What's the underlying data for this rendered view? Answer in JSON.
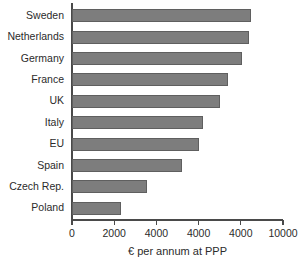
{
  "chart_data": {
    "type": "bar",
    "orientation": "horizontal",
    "title": "",
    "xlabel": "€ per annum at PPP",
    "ylabel": "",
    "xlim": [
      0,
      10000
    ],
    "grid": false,
    "legend": null,
    "categories": [
      "Sweden",
      "Netherlands",
      "Germany",
      "France",
      "UK",
      "Italy",
      "EU",
      "Spain",
      "Czech Rep.",
      "Poland"
    ],
    "values": [
      8500,
      8400,
      8050,
      7400,
      7000,
      6200,
      6000,
      5200,
      3550,
      2300
    ],
    "xticks": [
      0,
      2000,
      4000,
      6000,
      8000,
      10000
    ],
    "xtick_labels": [
      "0",
      "2000",
      "4000",
      "4000",
      "4000",
      "10000"
    ],
    "bar_color": "#7d7d7d",
    "bar_edge_color": "#5f5f5f",
    "axis_color": "#4a4a4a",
    "background_color": "#ffffff"
  }
}
